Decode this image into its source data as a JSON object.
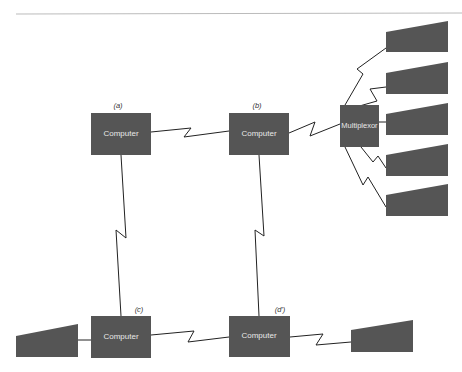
{
  "diagram": {
    "colors": {
      "node_fill": "#555555",
      "node_text": "#e8e8e8",
      "line": "#222222",
      "rule": "#bbbbbb",
      "background": "#ffffff"
    },
    "nodes": {
      "computer_a": {
        "label": "Computer",
        "tag": "(a)"
      },
      "computer_b": {
        "label": "Computer",
        "tag": "(b)"
      },
      "computer_c": {
        "label": "Computer",
        "tag": "(c)"
      },
      "computer_d": {
        "label": "Computer",
        "tag": "(d')"
      },
      "multiplexor": {
        "label": "Multiplexor"
      }
    },
    "terminals": [
      {
        "id": "terminal-1",
        "attached_to": "multiplexor"
      },
      {
        "id": "terminal-2",
        "attached_to": "multiplexor"
      },
      {
        "id": "terminal-3",
        "attached_to": "multiplexor"
      },
      {
        "id": "terminal-4",
        "attached_to": "multiplexor"
      },
      {
        "id": "terminal-5",
        "attached_to": "multiplexor"
      },
      {
        "id": "terminal-left",
        "attached_to": "computer_c"
      },
      {
        "id": "terminal-right",
        "attached_to": "computer_d"
      }
    ],
    "links": [
      {
        "from": "computer_a",
        "to": "computer_b",
        "type": "zigzag"
      },
      {
        "from": "computer_b",
        "to": "multiplexor",
        "type": "zigzag"
      },
      {
        "from": "computer_a",
        "to": "computer_c",
        "type": "zigzag"
      },
      {
        "from": "computer_b",
        "to": "computer_d",
        "type": "zigzag"
      },
      {
        "from": "computer_c",
        "to": "computer_d",
        "type": "zigzag"
      },
      {
        "from": "computer_d",
        "to": "terminal-right",
        "type": "zigzag"
      },
      {
        "from": "computer_c",
        "to": "terminal-left",
        "type": "straight"
      },
      {
        "from": "multiplexor",
        "to": "terminal-1",
        "type": "zigzag"
      },
      {
        "from": "multiplexor",
        "to": "terminal-2",
        "type": "zigzag"
      },
      {
        "from": "multiplexor",
        "to": "terminal-3",
        "type": "straight"
      },
      {
        "from": "multiplexor",
        "to": "terminal-4",
        "type": "zigzag"
      },
      {
        "from": "multiplexor",
        "to": "terminal-5",
        "type": "zigzag"
      }
    ]
  }
}
